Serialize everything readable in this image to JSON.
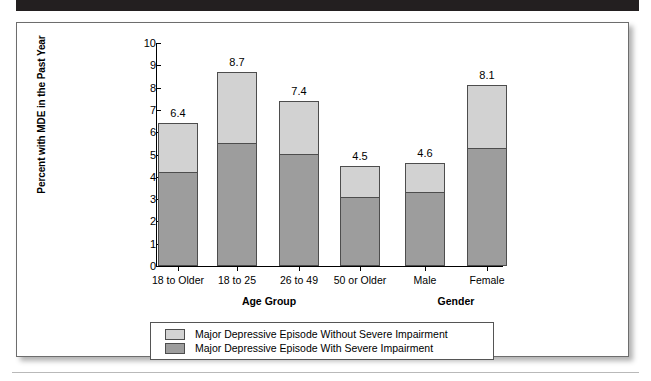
{
  "chart_data": {
    "type": "bar",
    "subtype": "stacked-bar",
    "title": "",
    "xlabel": "",
    "ylabel": "Percent with MDE in the Past Year",
    "ylim": [
      0,
      10
    ],
    "yticks": [
      0,
      1,
      2,
      3,
      4,
      5,
      6,
      7,
      8,
      9,
      10
    ],
    "ytick_labels": [
      "0",
      "1",
      "2",
      "3",
      "4",
      "5",
      "6",
      "7",
      "8",
      "9",
      "10"
    ],
    "grid": false,
    "legend_position": "bottom",
    "categories": [
      "18 to Older",
      "18 to 25",
      "26 to 49",
      "50 or Older",
      "Male",
      "Female"
    ],
    "group_labels": [
      {
        "label": "Age Group",
        "categories": [
          "18 to Older",
          "18 to 25",
          "26 to 49",
          "50 or Older"
        ]
      },
      {
        "label": "Gender",
        "categories": [
          "Male",
          "Female"
        ]
      }
    ],
    "series": [
      {
        "name": "Major Depressive Episode With Severe Impairment",
        "color": "#9d9d9d",
        "values": [
          4.2,
          5.5,
          5.0,
          3.1,
          3.3,
          5.3
        ]
      },
      {
        "name": "Major Depressive Episode Without Severe Impairment",
        "color": "#d2d2d2",
        "values": [
          2.2,
          3.2,
          2.4,
          1.4,
          1.3,
          2.8
        ]
      }
    ],
    "totals": [
      6.4,
      8.7,
      7.4,
      4.5,
      4.6,
      8.1
    ],
    "total_labels": [
      "6.4",
      "8.7",
      "7.4",
      "4.5",
      "4.6",
      "8.1"
    ]
  },
  "legend": {
    "items": [
      {
        "label": "Major Depressive Episode Without Severe Impairment",
        "color": "#d2d2d2"
      },
      {
        "label": "Major Depressive Episode With Severe Impairment",
        "color": "#9d9d9d"
      }
    ]
  },
  "colors": {
    "light_segment": "#d2d2d2",
    "dark_segment": "#9d9d9d",
    "band": "#231f20",
    "outline": "#4d4d4d"
  }
}
